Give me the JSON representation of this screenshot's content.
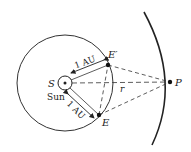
{
  "diagram": {
    "labels": {
      "sun_symbol": "S",
      "sun_name": "Sun",
      "earth_pos1": "E′",
      "earth_pos2": "E",
      "planet": "P",
      "distance": "r",
      "au_upper": "1 AU",
      "au_lower": "1 AU"
    },
    "colors": {
      "line": "#222222",
      "background": "#ffffff"
    }
  }
}
